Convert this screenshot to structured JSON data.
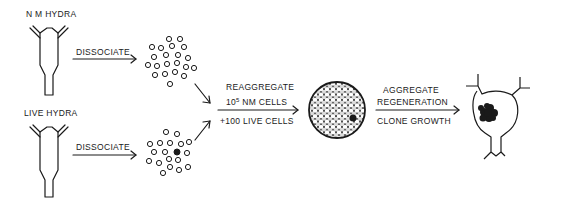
{
  "diagram": {
    "labels": {
      "nm_hydra": "N M HYDRA",
      "live_hydra": "LIVE HYDRA",
      "dissociate_top": "DISSOCIATE",
      "dissociate_bottom": "DISSOCIATE",
      "reaggregate": "REAGGREGATE",
      "nm_cells_prefix": "10",
      "nm_cells_exp": "5",
      "nm_cells_suffix": " NM CELLS",
      "live_cells": "+100 LIVE CELLS",
      "aggregate": "AGGREGATE",
      "regeneration": "REGENERATION",
      "clone_growth": "CLONE GROWTH"
    },
    "colors": {
      "ink": "#1a1a1a",
      "background": "#ffffff"
    },
    "nodes": [
      {
        "id": "nm-hydra",
        "label": "N M HYDRA",
        "shape": "hydra-body"
      },
      {
        "id": "live-hydra",
        "label": "LIVE HYDRA",
        "shape": "hydra-body"
      },
      {
        "id": "nm-cells-dissociated",
        "shape": "open-circle-cluster"
      },
      {
        "id": "live-cells-dissociated",
        "shape": "open-circle-cluster-with-one-filled"
      },
      {
        "id": "aggregate",
        "shape": "packed-circle-ball-with-one-filled"
      },
      {
        "id": "regenerated-hydra",
        "shape": "hydra-with-dark-clone"
      }
    ],
    "edges": [
      {
        "from": "nm-hydra",
        "to": "nm-cells-dissociated",
        "label": "DISSOCIATE"
      },
      {
        "from": "live-hydra",
        "to": "live-cells-dissociated",
        "label": "DISSOCIATE"
      },
      {
        "from": "nm-cells-dissociated",
        "to": "aggregate",
        "label": "REAGGREGATE 10^5 NM CELLS +100 LIVE CELLS"
      },
      {
        "from": "live-cells-dissociated",
        "to": "aggregate",
        "label": ""
      },
      {
        "from": "aggregate",
        "to": "regenerated-hydra",
        "label": "AGGREGATE REGENERATION / CLONE GROWTH"
      }
    ]
  }
}
